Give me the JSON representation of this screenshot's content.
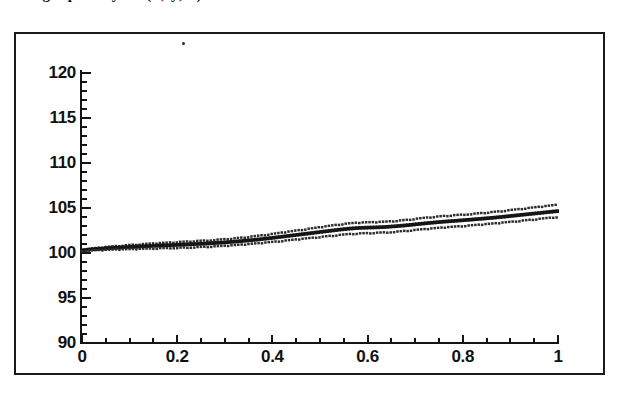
{
  "page": {
    "clipped_header_text": "the graph of y = f(x, y, z) for the data",
    "background_color": "#ffffff",
    "ink_color": "#141414"
  },
  "figure": {
    "frame": {
      "border_color": "#1a1a1a",
      "fill": "#ffffff"
    }
  },
  "chart_data": {
    "type": "line",
    "title": "",
    "subtitle": "",
    "xlabel": "",
    "ylabel": "",
    "xlim": [
      0,
      1
    ],
    "ylim": [
      90,
      120
    ],
    "grid": false,
    "legend_position": "none",
    "marker_style": "dotted",
    "x_ticks": [
      "0",
      "0.2",
      "0.4",
      "0.6",
      "0.8",
      "1"
    ],
    "x_tick_values": [
      0,
      0.2,
      0.4,
      0.6,
      0.8,
      1
    ],
    "x_minor_tick_step": 0.05,
    "y_ticks": [
      "90",
      "95",
      "100",
      "105",
      "110",
      "115",
      "120"
    ],
    "y_tick_values": [
      90,
      95,
      100,
      105,
      110,
      115,
      120
    ],
    "y_minor_tick_step": 1,
    "x": [
      0.0,
      0.02,
      0.04,
      0.06,
      0.08,
      0.1,
      0.12,
      0.14,
      0.16,
      0.18,
      0.2,
      0.22,
      0.24,
      0.26,
      0.28,
      0.3,
      0.32,
      0.34,
      0.36,
      0.38,
      0.4,
      0.42,
      0.44,
      0.46,
      0.48,
      0.5,
      0.52,
      0.54,
      0.56,
      0.58,
      0.6,
      0.62,
      0.64,
      0.66,
      0.68,
      0.7,
      0.72,
      0.74,
      0.76,
      0.78,
      0.8,
      0.82,
      0.84,
      0.86,
      0.88,
      0.9,
      0.92,
      0.94,
      0.96,
      0.98,
      1.0
    ],
    "series": [
      {
        "name": "upper band",
        "values": [
          100.35,
          100.5,
          100.62,
          100.72,
          100.82,
          100.9,
          100.97,
          101.04,
          101.1,
          101.16,
          101.22,
          101.28,
          101.34,
          101.4,
          101.47,
          101.55,
          101.64,
          101.74,
          101.86,
          101.99,
          102.13,
          102.28,
          102.43,
          102.58,
          102.73,
          102.88,
          103.03,
          103.18,
          103.3,
          103.38,
          103.42,
          103.45,
          103.5,
          103.58,
          103.68,
          103.8,
          103.92,
          104.03,
          104.12,
          104.2,
          104.28,
          104.36,
          104.45,
          104.55,
          104.66,
          104.78,
          104.9,
          105.02,
          105.14,
          105.26,
          105.38
        ]
      },
      {
        "name": "centre line",
        "values": [
          100.3,
          100.4,
          100.48,
          100.55,
          100.61,
          100.67,
          100.72,
          100.77,
          100.82,
          100.86,
          100.9,
          100.95,
          101.0,
          101.05,
          101.11,
          101.18,
          101.26,
          101.35,
          101.45,
          101.56,
          101.68,
          101.81,
          101.94,
          102.07,
          102.2,
          102.33,
          102.46,
          102.59,
          102.7,
          102.78,
          102.82,
          102.85,
          102.9,
          102.98,
          103.07,
          103.18,
          103.29,
          103.39,
          103.48,
          103.56,
          103.64,
          103.72,
          103.81,
          103.9,
          104.0,
          104.11,
          104.22,
          104.33,
          104.44,
          104.55,
          104.66
        ]
      },
      {
        "name": "lower band",
        "values": [
          100.25,
          100.3,
          100.34,
          100.38,
          100.41,
          100.44,
          100.47,
          100.5,
          100.53,
          100.56,
          100.59,
          100.62,
          100.66,
          100.7,
          100.75,
          100.81,
          100.88,
          100.96,
          101.05,
          101.14,
          101.24,
          101.35,
          101.46,
          101.57,
          101.68,
          101.79,
          101.9,
          102.01,
          102.11,
          102.18,
          102.22,
          102.26,
          102.31,
          102.38,
          102.47,
          102.57,
          102.67,
          102.76,
          102.85,
          102.93,
          103.01,
          103.09,
          103.18,
          103.27,
          103.37,
          103.47,
          103.58,
          103.69,
          103.8,
          103.91,
          104.02
        ]
      }
    ]
  }
}
